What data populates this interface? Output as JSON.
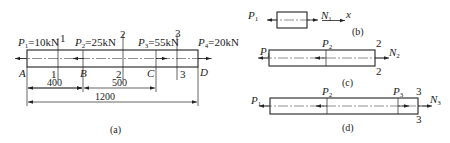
{
  "figure_a": {
    "caption": "(a)",
    "loads": [
      {
        "name": "P",
        "sub": "1",
        "value": "=10kN"
      },
      {
        "name": "P",
        "sub": "2",
        "value": "=25kN"
      },
      {
        "name": "P",
        "sub": "3",
        "value": "=55kN"
      },
      {
        "name": "P",
        "sub": "4",
        "value": "=20kN"
      }
    ],
    "points": [
      "A",
      "B",
      "C",
      "D"
    ],
    "sections": [
      "1",
      "2",
      "3"
    ],
    "dimensions": {
      "ab": "400",
      "bc": "500",
      "ad": "1200"
    }
  },
  "figure_b": {
    "caption": "(b)",
    "left_force": {
      "name": "P",
      "sub": "1"
    },
    "right_force": {
      "name": "N",
      "sub": "1"
    },
    "axis_label": "x"
  },
  "figure_c": {
    "caption": "(c)",
    "left_force": {
      "name": "P",
      "sub": "1"
    },
    "mid_force": {
      "name": "P",
      "sub": "2"
    },
    "right_force": {
      "name": "N",
      "sub": "2"
    },
    "section": "2"
  },
  "figure_d": {
    "caption": "(d)",
    "left_force": {
      "name": "P",
      "sub": "1"
    },
    "mid_force": {
      "name": "P",
      "sub": "2"
    },
    "mid2_force": {
      "name": "P",
      "sub": "3"
    },
    "right_force": {
      "name": "N",
      "sub": "3"
    },
    "section": "3"
  }
}
